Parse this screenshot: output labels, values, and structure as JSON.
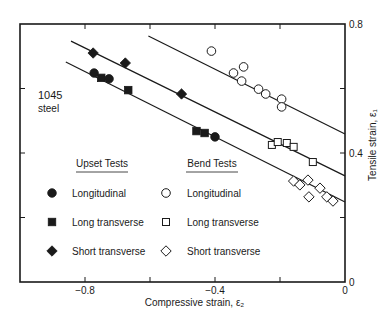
{
  "chart_data": {
    "type": "scatter",
    "title": "",
    "annotation": [
      "1045",
      "steel"
    ],
    "xlabel": "Compressive strain, ε₂",
    "ylabel": "Tensile strain, ε₁",
    "xlim": [
      -1.0,
      0
    ],
    "ylim": [
      0,
      0.8
    ],
    "x_ticks": [
      -1.0,
      -0.8,
      -0.6,
      -0.4,
      -0.2,
      0
    ],
    "x_tick_labels": {
      "-0.8": "−0.8",
      "-0.4": "−0.4",
      "0": "0"
    },
    "y_ticks": [
      0,
      0.2,
      0.4,
      0.6,
      0.8
    ],
    "y_tick_labels": {
      "0": "0",
      "0.4": "0.4",
      "0.8": "0.8"
    },
    "y_axis_side": "right",
    "grid": false,
    "legend": {
      "position": "lower-left-inside",
      "groups": [
        {
          "title": "Upset Tests",
          "entries": [
            {
              "label": "Longitudinal",
              "marker": "filled-circle"
            },
            {
              "label": "Long transverse",
              "marker": "filled-square"
            },
            {
              "label": "Short transverse",
              "marker": "filled-diamond"
            }
          ]
        },
        {
          "title": "Bend Tests",
          "entries": [
            {
              "label": "Longitudinal",
              "marker": "open-circle"
            },
            {
              "label": "Long transverse",
              "marker": "open-square"
            },
            {
              "label": "Short transverse",
              "marker": "open-diamond"
            }
          ]
        }
      ]
    },
    "series": [
      {
        "name": "Upset Tests - Longitudinal",
        "marker": "filled-circle",
        "points": [
          [
            -0.772,
            0.648
          ],
          [
            -0.726,
            0.63
          ],
          [
            -0.4,
            0.45
          ]
        ]
      },
      {
        "name": "Upset Tests - Long transverse",
        "marker": "filled-square",
        "points": [
          [
            -0.75,
            0.633
          ],
          [
            -0.667,
            0.595
          ],
          [
            -0.457,
            0.468
          ],
          [
            -0.432,
            0.462
          ]
        ]
      },
      {
        "name": "Upset Tests - Short transverse",
        "marker": "filled-diamond",
        "points": [
          [
            -0.775,
            0.71
          ],
          [
            -0.676,
            0.679
          ],
          [
            -0.503,
            0.583
          ]
        ]
      },
      {
        "name": "Bend Tests - Longitudinal",
        "marker": "open-circle",
        "points": [
          [
            -0.411,
            0.716
          ],
          [
            -0.343,
            0.648
          ],
          [
            -0.312,
            0.667
          ],
          [
            -0.318,
            0.623
          ],
          [
            -0.266,
            0.598
          ],
          [
            -0.244,
            0.583
          ],
          [
            -0.195,
            0.567
          ],
          [
            -0.195,
            0.543
          ]
        ]
      },
      {
        "name": "Bend Tests - Long transverse",
        "marker": "open-square",
        "points": [
          [
            -0.225,
            0.425
          ],
          [
            -0.207,
            0.434
          ],
          [
            -0.179,
            0.431
          ],
          [
            -0.158,
            0.419
          ],
          [
            -0.099,
            0.372
          ]
        ]
      },
      {
        "name": "Bend Tests - Short transverse",
        "marker": "open-diamond",
        "points": [
          [
            -0.158,
            0.313
          ],
          [
            -0.139,
            0.301
          ],
          [
            -0.114,
            0.316
          ],
          [
            -0.111,
            0.264
          ],
          [
            -0.077,
            0.291
          ],
          [
            -0.056,
            0.264
          ],
          [
            -0.037,
            0.251
          ]
        ]
      }
    ],
    "fit_lines": [
      {
        "name": "upper-fit-line",
        "from": [
          -0.605,
          0.763
        ],
        "to": [
          0,
          0.459
        ]
      },
      {
        "name": "middle-fit-line",
        "from": [
          -0.843,
          0.747
        ],
        "to": [
          0,
          0.329
        ]
      },
      {
        "name": "lower-fit-line",
        "from": [
          -0.859,
          0.682
        ],
        "to": [
          0,
          0.248
        ]
      }
    ]
  },
  "colors": {
    "ink": "#1a1a1a",
    "background": "#ffffff"
  }
}
